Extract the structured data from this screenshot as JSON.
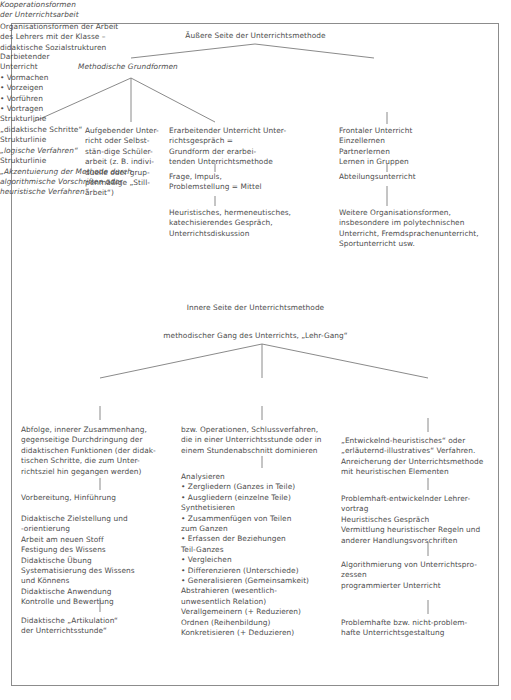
{
  "figure": {
    "border_color": "#8c8c8c",
    "line_color": "#7d7d7d",
    "text_color": "#4d4d4d",
    "background": "#ffffff"
  },
  "top": {
    "root_title": "Äußere Seite der Unterrichtsmethode",
    "branch_methodische": {
      "heading_italic": "Methodische Grundformen"
    },
    "branch_kooperation": {
      "heading_italic": "Kooperationsformen\nder Unterrichtsarbeit",
      "body": "Organisationsformen der Arbeit\ndes Lehrers mit der Klasse –\ndidaktische Sozialstrukturen",
      "level2": "Frontaler Unterricht\nEinzellernen\nPartnerlernen\nLernen in Gruppen",
      "level3": "Abteilungsunterricht",
      "level4": "Weitere Organisationsformen,\ninsbesondere im polytechnischen\nUnterricht, Fremdsprachenunterricht,\nSportunterricht usw."
    },
    "leaf_darbietend": {
      "title": "Darbietender\nUnterricht",
      "items": "• Vormachen\n• Vorzeigen\n• Vorführen\n• Vortragen"
    },
    "leaf_aufgebend": {
      "text": "Aufgebender Unter-\nricht oder Selbst-\nstän-dige Schüler-\narbeit (z. B. indivi-\nduelle oder grup-\npenmäßige „Still-\narbeit“)"
    },
    "leaf_erarbeitend": {
      "text": "Erarbeitender Unterricht Unter-\nrichtsgespräch =\nGrundform der erarbei-\ntenden Unterrichtsmethode",
      "level2": "Frage, Impuls,\nProblemstellung = Mittel",
      "level3": "Heuristisches, hermeneutisches,\nkatechisierendes Gespräch,\nUnterrichtsdiskussion"
    }
  },
  "middle": {
    "inner_title": "Innere Seite der Unterrichtsmethode",
    "inner_subtitle": "methodischer Gang des Unterrichts, „Lehr-Gang“"
  },
  "columns": {
    "col1": {
      "heading_plain": "Strukturlinie",
      "heading_quoted": "„didaktische Schritte“",
      "block1": "Abfolge, innerer Zusammenhang,\ngegenseitige Durchdringung der\ndidaktischen Funktionen (der didak-\ntischen Schritte, die zum Unter-\nrichtsziel hin gegangen werden)",
      "block2": "Vorbereitung, Hinführung",
      "block3": "Didaktische Zielstellung und\n-orientierung\nArbeit am neuen Stoff\nFestigung des Wissens\nDidaktische Übung\nSystematisierung des Wissens\nund Könnens\nDidaktische Anwendung\nKontrolle und Bewertung",
      "block4": "Didaktische „Artikulation“\nder Unterrichtsstunde“"
    },
    "col2": {
      "heading_plain": "Strukturlinie",
      "heading_quoted_italic": "„logische Verfahren“",
      "block1": "bzw. Operationen, Schlussverfahren,\ndie in einer Unterrichtsstunde oder in\neinem Stundenabschnitt dominieren",
      "block2": "Analysieren\n• Zergliedern (Ganzes in Teile)\n• Ausgliedern (einzelne Teile)\nSynthetisieren\n• Zusammenfügen von Teilen\n   zum Ganzen\n• Erfassen der Beziehungen\n   Teil-Ganzes\n• Vergleichen\n• Differenzieren (Unterschiede)\n• Generalisieren (Gemeinsamkeit)\nAbstrahieren (wesentlich-\nunwesentlich Relation)\nVerallgemeinern (+ Reduzieren)\nOrdnen (Reihenbildung)\nKonkretisieren (+ Deduzieren)"
    },
    "col3": {
      "heading_plain": "Strukturlinie",
      "heading_quoted_italic": "„Akzentuierung der Methode durch\nalgorithmische Vorschriften oder\nheuristische Verfahren“",
      "block1": "„Entwickelnd-heuristisches“ oder\n„erläuternd-illustratives“ Verfahren.\nAnreicherung der Unterrichtsmethode\nmit heuristischen Elementen",
      "block2": "Problemhaft-entwickelnder Lehrer-\nvortrag\nHeuristisches Gespräch\nVermittlung heuristischer Regeln und\nanderer Handlungsvorschriften",
      "block3": "Algorithmierung von Unterrichtspro-\nzessen\nprogrammierter Unterricht",
      "block4": "Problemhafte bzw. nicht-problem-\nhafte Unterrichtsgestaltung"
    }
  }
}
